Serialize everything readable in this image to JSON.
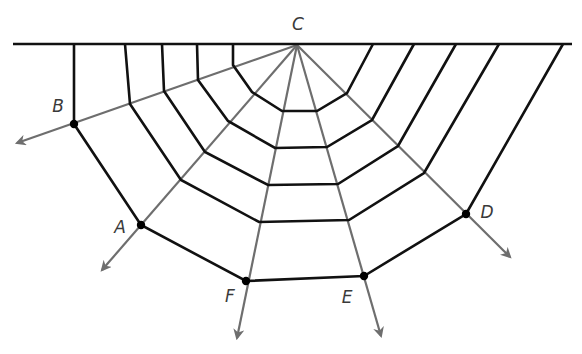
{
  "diagram": {
    "title": "",
    "colors": {
      "web_line": "#111111",
      "ray_line": "#6e6e6e",
      "point": "#000000",
      "label": "#3a3a3a"
    },
    "top_line": {
      "x1": 13,
      "y1": 44,
      "x2": 572,
      "y2": 44
    },
    "center": {
      "label": "C",
      "x": 297,
      "y": 45,
      "label_x": 298,
      "label_y": 24
    },
    "points": [
      {
        "label": "B",
        "x": 74,
        "y": 124,
        "label_x": 58,
        "label_y": 106,
        "arrow_tip": [
          17,
          143
        ]
      },
      {
        "label": "A",
        "x": 141,
        "y": 225,
        "label_x": 120,
        "label_y": 227,
        "arrow_tip": [
          102,
          270
        ]
      },
      {
        "label": "F",
        "x": 246,
        "y": 281,
        "label_x": 230,
        "label_y": 296,
        "arrow_tip": [
          237,
          338
        ]
      },
      {
        "label": "E",
        "x": 364,
        "y": 276,
        "label_x": 347,
        "label_y": 297,
        "arrow_tip": [
          381,
          336
        ]
      },
      {
        "label": "D",
        "x": 466,
        "y": 214,
        "label_x": 487,
        "label_y": 212,
        "arrow_tip": [
          510,
          257
        ]
      }
    ],
    "rings": [
      [
        [
          233,
          44
        ],
        [
          233,
          65
        ],
        [
          252,
          92
        ],
        [
          282,
          111
        ],
        [
          317,
          111
        ],
        [
          347,
          93
        ],
        [
          373,
          44
        ]
      ],
      [
        [
          197,
          44
        ],
        [
          198,
          80
        ],
        [
          228,
          121
        ],
        [
          275,
          148
        ],
        [
          327,
          147
        ],
        [
          372,
          120
        ],
        [
          414,
          44
        ]
      ],
      [
        [
          162,
          44
        ],
        [
          164,
          91
        ],
        [
          205,
          152
        ],
        [
          268,
          185
        ],
        [
          338,
          184
        ],
        [
          398,
          146
        ],
        [
          456,
          44
        ]
      ],
      [
        [
          125,
          44
        ],
        [
          130,
          104
        ],
        [
          181,
          180
        ],
        [
          259,
          222
        ],
        [
          349,
          220
        ],
        [
          424,
          173
        ],
        [
          499,
          44
        ]
      ],
      [
        [
          74,
          44
        ],
        [
          74,
          124
        ],
        [
          141,
          225
        ],
        [
          246,
          281
        ],
        [
          364,
          276
        ],
        [
          466,
          214
        ],
        [
          563,
          44
        ]
      ]
    ]
  }
}
